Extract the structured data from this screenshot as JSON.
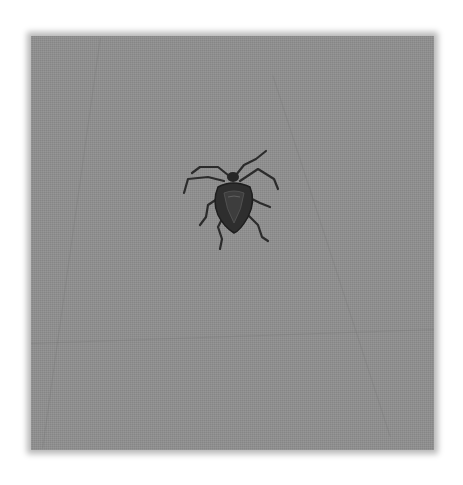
{
  "image": {
    "subject": "shield bug (stink bug)",
    "description": "Grayscale photo of a dark shield-shaped bug with long legs and antennae resting on a gray textured surface",
    "background_color": "#ffffff",
    "surface_color": "#8f8f8f",
    "bug_color": "#2a2a2a",
    "icon": "bug-photo"
  }
}
